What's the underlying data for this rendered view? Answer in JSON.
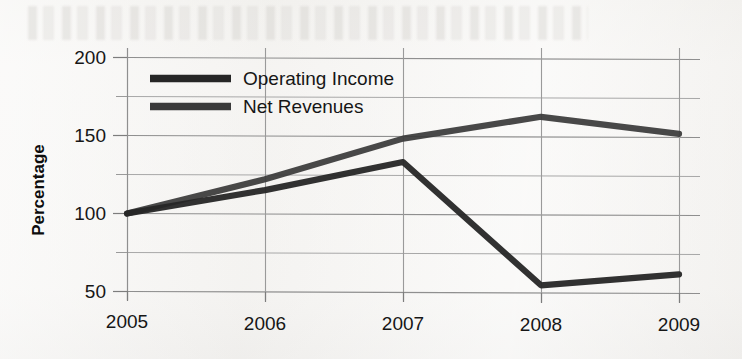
{
  "chart_data": {
    "type": "line",
    "title": "",
    "xlabel": "",
    "ylabel": "Percentage",
    "categories": [
      "2005",
      "2006",
      "2007",
      "2008",
      "2009"
    ],
    "ylim": [
      50,
      200
    ],
    "yticks": [
      50,
      100,
      150,
      200
    ],
    "ytick_labels": [
      "50",
      "100",
      "150",
      "200"
    ],
    "minor_yticks": [
      75,
      125,
      175
    ],
    "grid": true,
    "legend_position": "upper-left-inside",
    "series": [
      {
        "name": "Operating Income",
        "values": [
          100,
          115,
          133,
          54,
          61
        ],
        "color": "#2b2b2b"
      },
      {
        "name": "Net Revenues",
        "values": [
          100,
          122,
          148,
          162,
          151
        ],
        "color": "#3a3a3a"
      }
    ]
  },
  "axis": {
    "y_title": "Percentage",
    "y_tick_200": "200",
    "y_tick_150": "150",
    "y_tick_100": "100",
    "y_tick_50": "50",
    "x_tick_2005": "2005",
    "x_tick_2006": "2006",
    "x_tick_2007": "2007",
    "x_tick_2008": "2008",
    "x_tick_2009": "2009"
  },
  "legend": {
    "entry_0_label": "Operating Income",
    "entry_1_label": "Net Revenues"
  },
  "colors": {
    "line_operating_income": "#2b2b2b",
    "line_net_revenues": "#3a3a3a",
    "gridline": "#9a9a9a",
    "axis": "#7d7d7d",
    "background": "#f4f3f1",
    "text": "#161616"
  }
}
